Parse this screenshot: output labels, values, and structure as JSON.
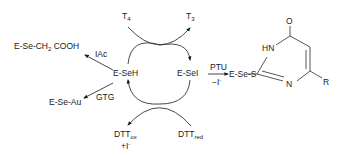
{
  "diagram": {
    "nodes": {
      "eseh": "E-SeH",
      "esei": "E-SeI",
      "ese_ch2cooh_a": "E-Se-CH",
      "ese_ch2cooh_sub": "2",
      "ese_ch2cooh_b": " COOH",
      "ese_au": "E-Se-Au",
      "ese_s": "E-Se-S",
      "t4_main": "T",
      "t4_sub": "4",
      "t3_main": "T",
      "t3_sub": "3",
      "dttox_main": "DTT",
      "dttox_sub": "ox",
      "dttox_iodide": "+I",
      "dttox_iodide_sup": "-",
      "dttred_main": "DTT",
      "dttred_sub": "red"
    },
    "reagents": {
      "iac": "IAc",
      "gtg": "GTG",
      "ptu": "PTU",
      "minus_iodide": "−I",
      "minus_iodide_sup": "-"
    },
    "ring": {
      "carbonyl_o": "O",
      "nh": "HN",
      "n": "N",
      "r_group": "R"
    },
    "arrows": [
      {
        "from": "T4",
        "to": "T3",
        "type": "curved"
      },
      {
        "from": "E-SeH",
        "to": "E-SeI",
        "type": "curved"
      },
      {
        "from": "E-SeI",
        "to": "E-SeH",
        "type": "curved"
      },
      {
        "from": "DTTred",
        "to": "DTTox",
        "type": "curved"
      },
      {
        "from": "E-SeH",
        "to": "E-Se-CH2 COOH",
        "label": "IAc"
      },
      {
        "from": "E-SeH",
        "to": "E-Se-Au",
        "label": "GTG"
      },
      {
        "from": "E-SeI",
        "to": "E-Se-S",
        "label": "PTU / −I-"
      }
    ]
  }
}
